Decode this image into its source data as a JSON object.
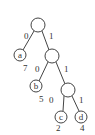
{
  "diagram": {
    "type": "huffman-tree",
    "colors": {
      "stroke": "#444444",
      "text": "#333333",
      "background": "#ffffff"
    },
    "nodes": [
      {
        "id": "root",
        "label": "",
        "x": 38,
        "y": 25,
        "r": 7
      },
      {
        "id": "n1",
        "label": "",
        "x": 52,
        "y": 56,
        "r": 7
      },
      {
        "id": "n2",
        "label": "",
        "x": 68,
        "y": 90,
        "r": 7
      },
      {
        "id": "a",
        "label": "a",
        "x": 20,
        "y": 55,
        "r": 6,
        "weight": "7"
      },
      {
        "id": "b",
        "label": "b",
        "x": 36,
        "y": 86,
        "r": 6,
        "weight": "5"
      },
      {
        "id": "c",
        "label": "c",
        "x": 61,
        "y": 117,
        "r": 6,
        "weight": "2"
      },
      {
        "id": "d",
        "label": "d",
        "x": 81,
        "y": 117,
        "r": 6,
        "weight": "4"
      }
    ],
    "edges": [
      {
        "from": "root",
        "to": "a",
        "label": "0"
      },
      {
        "from": "root",
        "to": "n1",
        "label": "1"
      },
      {
        "from": "n1",
        "to": "b",
        "label": "0"
      },
      {
        "from": "n1",
        "to": "n2",
        "label": "1"
      },
      {
        "from": "n2",
        "to": "c",
        "label": "0"
      },
      {
        "from": "n2",
        "to": "d",
        "label": "1"
      }
    ]
  }
}
